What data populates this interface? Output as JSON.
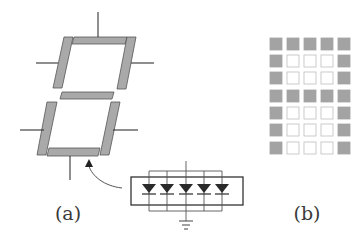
{
  "figure": {
    "panel_a": {
      "label": "(a)",
      "description": "Seven-segment display",
      "segment_color": "#a9a9a9",
      "segment_stroke": "#555555",
      "lead_color": "#333333",
      "segments": [
        {
          "id": "a",
          "points": "74,37 127,37 125,44 72,44"
        },
        {
          "id": "b",
          "points": "127,37 136,37 126,89 117,89"
        },
        {
          "id": "c",
          "points": "111,102 120,102 109,155 100,155"
        },
        {
          "id": "d",
          "points": "49,148 100,148 98,156 47,156"
        },
        {
          "id": "e",
          "points": "47,102 57,102 46,155 37,155"
        },
        {
          "id": "f",
          "points": "64,37 73,37 62,88 53,88"
        },
        {
          "id": "g",
          "points": "62,92 114,92 112,99 60,99"
        }
      ],
      "leads": [
        {
          "x1": 98,
          "y1": 12,
          "x2": 98,
          "y2": 37
        },
        {
          "x1": 36,
          "y1": 63,
          "x2": 58,
          "y2": 63
        },
        {
          "x1": 131,
          "y1": 63,
          "x2": 154,
          "y2": 63
        },
        {
          "x1": 20,
          "y1": 130,
          "x2": 44,
          "y2": 130
        },
        {
          "x1": 113,
          "y1": 130,
          "x2": 138,
          "y2": 130
        },
        {
          "x1": 70,
          "y1": 156,
          "x2": 70,
          "y2": 180
        }
      ],
      "inset": {
        "description": "Segment composed of 5 LEDs in parallel",
        "diode_count": 5,
        "diode_centers_x": [
          149,
          167,
          186,
          204,
          222
        ],
        "ground_symbol": "ground-icon"
      }
    },
    "panel_b": {
      "label": "(b)",
      "description": "5x7 dot-matrix display showing letter A",
      "on_color": "#a3a3a3",
      "off_color": "#ffffff",
      "off_stroke": "#bdbdbd",
      "rows": 7,
      "cols": 5,
      "matrix": [
        [
          1,
          1,
          1,
          1,
          1
        ],
        [
          1,
          0,
          0,
          0,
          1
        ],
        [
          1,
          0,
          0,
          0,
          1
        ],
        [
          1,
          1,
          1,
          1,
          1
        ],
        [
          1,
          0,
          0,
          0,
          1
        ],
        [
          1,
          0,
          0,
          0,
          1
        ],
        [
          1,
          0,
          0,
          0,
          1
        ]
      ]
    }
  }
}
